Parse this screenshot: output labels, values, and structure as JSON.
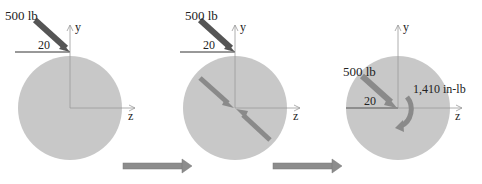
{
  "colors": {
    "disk_fill": "#c8c8c8",
    "force_arrow": "#555555",
    "interior_arrow": "#8a8a8a",
    "moment_arrow": "#8a8a8a",
    "step_arrow": "#8c8c8c",
    "axis": "#9a9a9a",
    "reference_line": "#333333"
  },
  "panels": [
    {
      "force_label": "500 lb",
      "angle_label": "20",
      "y_axis_label": "y",
      "z_axis_label": "z"
    },
    {
      "force_label": "500 lb",
      "angle_label": "20",
      "y_axis_label": "y",
      "z_axis_label": "z"
    },
    {
      "force_label": "500 lb",
      "angle_label": "20",
      "moment_label": "1,410 in-lb",
      "y_axis_label": "y",
      "z_axis_label": "z"
    }
  ]
}
